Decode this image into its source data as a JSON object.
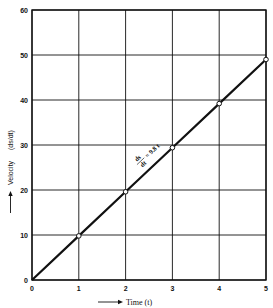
{
  "chart_data": {
    "type": "line",
    "title": "",
    "xlabel": "Time (t)",
    "ylabel": "Velocity (ds/dt)",
    "xlim": [
      0,
      5
    ],
    "ylim": [
      0,
      60
    ],
    "x_ticks": [
      "0",
      "1",
      "2",
      "3",
      "4",
      "5"
    ],
    "y_ticks": [
      "0",
      "10",
      "20",
      "30",
      "40",
      "50",
      "60"
    ],
    "grid": true,
    "legend": null,
    "series": [
      {
        "name": "ds/dt = 9.8 t",
        "x": [
          0,
          1,
          2,
          3,
          4,
          5
        ],
        "y": [
          0,
          9.8,
          19.6,
          29.4,
          39.2,
          49.0
        ],
        "markers": [
          false,
          true,
          true,
          true,
          true,
          true
        ]
      }
    ],
    "annotations": [
      {
        "text_num": "ds",
        "text_den": "dt",
        "text_rhs": "= 9.8 t",
        "x": 2.5,
        "y": 24.5
      }
    ]
  },
  "labels": {
    "x_axis": "Time (t)",
    "y_axis_word": "Velocity",
    "y_axis_expr": "(ds/dt)",
    "annotation_num": "ds",
    "annotation_den": "dt",
    "annotation_rhs": "= 9.8 t"
  },
  "colors": {
    "ink": "#111111",
    "background": "#ffffff"
  }
}
